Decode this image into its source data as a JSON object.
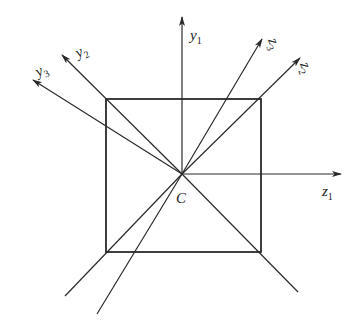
{
  "diagram": {
    "type": "coordinate-axes-on-square-section",
    "colors": {
      "line": "#2a2a2a",
      "background": "#ffffff"
    },
    "center": {
      "name": "C",
      "label": "C"
    },
    "square": {
      "label": "square cross-section"
    },
    "axes": [
      {
        "id": "y1",
        "symbol": "y",
        "subscript": "1"
      },
      {
        "id": "y2",
        "symbol": "y",
        "subscript": "2"
      },
      {
        "id": "y3",
        "symbol": "y",
        "subscript": "3"
      },
      {
        "id": "z1",
        "symbol": "z",
        "subscript": "1"
      },
      {
        "id": "z2",
        "symbol": "z",
        "subscript": "2"
      },
      {
        "id": "z3",
        "symbol": "z",
        "subscript": "3"
      }
    ]
  }
}
